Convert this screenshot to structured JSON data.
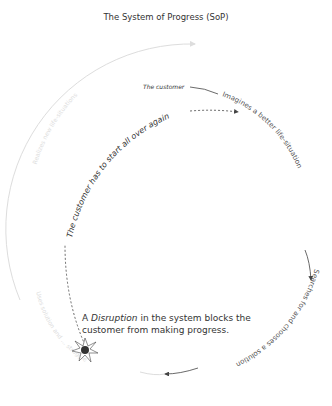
{
  "title": "The System of Progress (SoP)",
  "labels": {
    "the_customer": "The customer",
    "imagines": "Imagines a better life-situation",
    "searches": "Searches for and chooses a solution",
    "uses": "Uses solution and ... struggle",
    "realizes": "Realizes new life-situations",
    "restart": "The customer has to start all over again"
  },
  "note": {
    "prefix": "A",
    "emphasis": "Disruption",
    "rest": "in the system blocks the customer from making progress."
  },
  "colors": {
    "active": "#444444",
    "faded": "#dddddd"
  }
}
